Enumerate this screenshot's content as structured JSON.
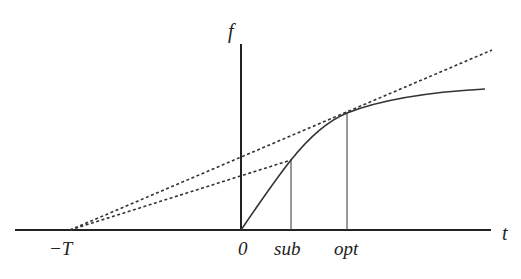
{
  "diagram": {
    "axes": {
      "x_label": "t",
      "y_label": "f"
    },
    "tick_labels": {
      "neg_T": "−T",
      "zero": "0",
      "sub": "sub",
      "opt": "opt"
    },
    "elements": [
      "horizontal t axis",
      "vertical f axis at 0",
      "concave increasing curve f(t) from origin",
      "dashed line from −T tangent to curve at opt",
      "dashed line from −T to curve at sub",
      "vertical drop line at sub",
      "vertical drop line at opt"
    ],
    "colors": {
      "line": "#222222",
      "background": "#ffffff"
    }
  }
}
